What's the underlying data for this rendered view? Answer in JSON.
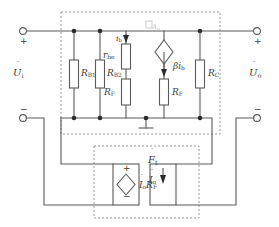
{
  "figure": {
    "type": "small-signal-equivalent-circuit",
    "title_text": ""
  },
  "terminals": {
    "input": {
      "plus": "+",
      "minus": "−",
      "voltage_label": "U",
      "voltage_sub": "i",
      "name": "input-port"
    },
    "output": {
      "plus": "+",
      "minus": "−",
      "voltage_label": "U",
      "voltage_sub": "o",
      "name": "output-port"
    }
  },
  "components": {
    "rb1": {
      "label": "R",
      "sub": "B1"
    },
    "rb2": {
      "label": "R",
      "sub": "B2"
    },
    "rbe": {
      "label": "r",
      "sub": "be"
    },
    "rf_left": {
      "label": "R",
      "sub": "F"
    },
    "rf_right": {
      "label": "R",
      "sub": "F"
    },
    "rc": {
      "label": "R",
      "sub": "C"
    },
    "beta_ib": {
      "label": "βi",
      "sub": "b"
    },
    "ib_current": {
      "label": "i",
      "sub": "b"
    },
    "src_marker": {
      "label": "A",
      "sub": "g"
    }
  },
  "feedback": {
    "block_label": "F",
    "block_sub": "t",
    "source_label": "I",
    "source_sub": "o",
    "source_label2": "R",
    "source_sub2": "F",
    "source_plus": "+",
    "source_minus": "−",
    "current_label": "I",
    "current_sub": "o"
  },
  "colors": {
    "wire": "#5a5a5a",
    "dashed": "#9a9a9a",
    "text": "#3b3b3b",
    "node": "#2b2b2b",
    "background": "#ffffff"
  }
}
